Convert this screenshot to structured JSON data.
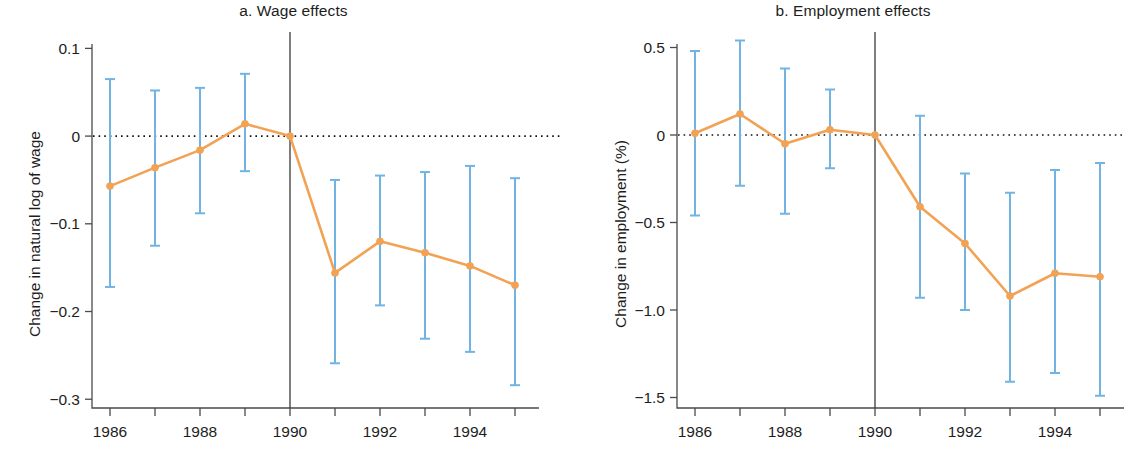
{
  "figure": {
    "background": "#ffffff",
    "series_color": "#f2a254",
    "errorbar_color": "#71b4e3",
    "axis_color": "#4a4a4a",
    "text_color": "#1d1d1d"
  },
  "panels": [
    {
      "key": "a",
      "title": "a. Wage effects",
      "ylabel": "Change in natural log of wage",
      "xlabel": "",
      "y_ticks": [
        "0.1",
        "0",
        "−0.1",
        "−0.2",
        "−0.3"
      ],
      "y_tick_values": [
        0.1,
        0,
        -0.1,
        -0.2,
        -0.3
      ],
      "x_ticks": [
        "1986",
        "",
        "1988",
        "",
        "1990",
        "",
        "1992",
        "",
        "1994",
        ""
      ],
      "x_tick_values": [
        1986,
        1987,
        1988,
        1989,
        1990,
        1991,
        1992,
        1993,
        1994,
        1995
      ]
    },
    {
      "key": "b",
      "title": "b. Employment effects",
      "ylabel": "Change in employment (%)",
      "xlabel": "",
      "y_ticks": [
        "0.5",
        "0",
        "−0.5",
        "−1.0",
        "−1.5"
      ],
      "y_tick_values": [
        0.5,
        0,
        -0.5,
        -1.0,
        -1.5
      ],
      "x_ticks": [
        "1986",
        "",
        "1988",
        "",
        "1990",
        "",
        "1992",
        "",
        "1994",
        ""
      ],
      "x_tick_values": [
        1986,
        1987,
        1988,
        1989,
        1990,
        1991,
        1992,
        1993,
        1994,
        1995
      ]
    }
  ],
  "chart_data": [
    {
      "type": "line",
      "panel": "a",
      "title": "a. Wage effects",
      "xlabel": "",
      "ylabel": "Change in natural log of wage",
      "x": [
        1986,
        1987,
        1988,
        1989,
        1990,
        1991,
        1992,
        1993,
        1994,
        1995
      ],
      "values": [
        -0.057,
        -0.036,
        -0.016,
        0.014,
        0.0,
        -0.156,
        -0.12,
        -0.133,
        -0.148,
        -0.17
      ],
      "ci_low": [
        -0.172,
        -0.125,
        -0.088,
        -0.04,
        0.0,
        -0.259,
        -0.193,
        -0.231,
        -0.246,
        -0.284
      ],
      "ci_high": [
        0.065,
        0.052,
        0.055,
        0.071,
        0.0,
        -0.05,
        -0.045,
        -0.041,
        -0.034,
        -0.048
      ],
      "xlim": [
        1985.6,
        1995.4
      ],
      "ylim": [
        -0.31,
        0.105
      ],
      "reference_line_y": 0,
      "reference_line_style": "dotted",
      "vertical_marker_x": 1990,
      "grid": false,
      "legend": "none"
    },
    {
      "type": "line",
      "panel": "b",
      "title": "b. Employment effects",
      "xlabel": "",
      "ylabel": "Change in employment (%)",
      "x": [
        1986,
        1987,
        1988,
        1989,
        1990,
        1991,
        1992,
        1993,
        1994,
        1995
      ],
      "values": [
        0.01,
        0.12,
        -0.05,
        0.03,
        0.0,
        -0.41,
        -0.62,
        -0.92,
        -0.79,
        -0.81
      ],
      "ci_low": [
        -0.46,
        -0.29,
        -0.45,
        -0.19,
        0.0,
        -0.93,
        -1.0,
        -1.41,
        -1.36,
        -1.49
      ],
      "ci_high": [
        0.48,
        0.54,
        0.38,
        0.26,
        0.0,
        0.11,
        -0.22,
        -0.33,
        -0.2,
        -0.16
      ],
      "xlim": [
        1985.6,
        1995.4
      ],
      "ylim": [
        -1.56,
        0.52
      ],
      "reference_line_y": 0,
      "reference_line_style": "dotted",
      "vertical_marker_x": 1990,
      "grid": false,
      "legend": "none"
    }
  ]
}
